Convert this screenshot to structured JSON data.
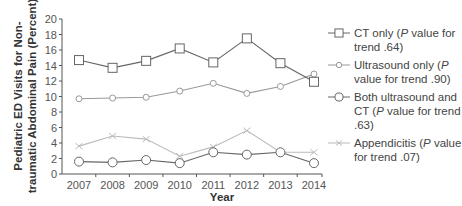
{
  "chart_data": {
    "type": "line",
    "title": "",
    "xlabel": "Year",
    "ylabel": "Pediatric ED Visits for Non-traumatic Abdominal Pain (Percent)",
    "ylabel_lines": [
      "Pediatric ED Visits for Non-",
      "traumatic Abdominal Pain (Percent)"
    ],
    "x": [
      "2007",
      "2008",
      "2009",
      "2010",
      "2011",
      "2012",
      "2013",
      "2014"
    ],
    "ylim": [
      0,
      20
    ],
    "yticks": [
      "0",
      "2",
      "4",
      "6",
      "8",
      "10",
      "12",
      "14",
      "16",
      "18",
      "20"
    ],
    "grid": false,
    "legend_position": "right",
    "series": [
      {
        "name": "CT only (P value for trend .64)",
        "legend_parts": [
          "CT only (",
          "P",
          " value for trend .64)"
        ],
        "marker": "square",
        "color": "#666666",
        "values": [
          14.7,
          13.7,
          14.6,
          16.2,
          14.4,
          17.5,
          14.3,
          11.9
        ]
      },
      {
        "name": "Ultrasound only (P value for trend .90)",
        "legend_parts": [
          "Ultrasound only (",
          "P",
          " value for trend .90)"
        ],
        "marker": "diamond",
        "color": "#999999",
        "values": [
          9.7,
          9.8,
          9.9,
          10.7,
          11.7,
          10.4,
          11.3,
          12.9
        ]
      },
      {
        "name": "Both ultrasound and CT (P value for trend .63)",
        "legend_parts": [
          "Both ultrasound and CT (",
          "P",
          " value for trend .63)"
        ],
        "marker": "circle",
        "color": "#666666",
        "values": [
          1.6,
          1.5,
          1.8,
          1.4,
          2.8,
          2.5,
          2.8,
          1.4
        ]
      },
      {
        "name": "Appendicitis (P value for trend .07)",
        "legend_parts": [
          "Appendicitis (",
          "P",
          " value for trend .07)"
        ],
        "marker": "x",
        "color": "#bbbbbb",
        "values": [
          3.6,
          4.9,
          4.5,
          2.3,
          3.5,
          5.6,
          2.8,
          2.8
        ]
      }
    ]
  }
}
